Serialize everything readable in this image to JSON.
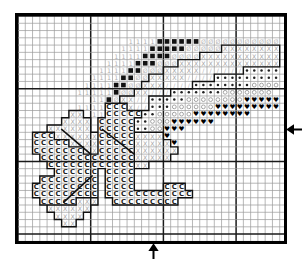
{
  "doc": {
    "kind": "cross-stitch-pattern-chart",
    "title": "Cross Stitch Pattern Chart",
    "background_color": "#ffffff",
    "frame_color": "#000000"
  },
  "grid": {
    "columns": 37,
    "rows": 32,
    "cell_size_px": 7.27,
    "minor_line_color": "#9a9a9a",
    "major_line_color": "#1a1a1a",
    "major_every": 10,
    "major_columns": [
      0,
      10,
      20,
      30,
      37
    ],
    "major_rows": [
      0,
      10,
      20,
      30,
      32
    ]
  },
  "markers": {
    "right_arrow": {
      "name": "center-marker-right",
      "glyph": "←",
      "row": 15
    },
    "bottom_arrow": {
      "name": "center-marker-bottom",
      "glyph": "↑",
      "column": 18
    }
  },
  "symbols": {
    "1": {
      "id": "one",
      "glyph": "1",
      "color": "#b0b0b0",
      "description": "light gray numeral one"
    },
    "B": {
      "id": "black-square",
      "glyph": "■",
      "color": "#111111",
      "description": "solid black square"
    },
    "O": {
      "id": "slashed-o",
      "glyph": "Ø",
      "color": "#bdbdbd",
      "description": "gray slashed O"
    },
    "X": {
      "id": "cross-x",
      "glyph": "X",
      "color": "#9e9e9e",
      "description": "gray letter X"
    },
    "S": {
      "id": "slash",
      "glyph": "/",
      "color": "#b5b5b5",
      "description": "gray forward slash"
    },
    "D": {
      "id": "dot",
      "glyph": "•",
      "color": "#222222",
      "description": "small filled dot"
    },
    "C": {
      "id": "open-circle",
      "glyph": "○",
      "color": "#9a9a9a",
      "description": "gray open circle"
    },
    "H": {
      "id": "heart",
      "glyph": "♥",
      "color": "#000000",
      "description": "solid black heart"
    },
    "c": {
      "id": "letter-c",
      "glyph": "C",
      "color": "#1a1a1a",
      "description": "bold letter C"
    }
  },
  "chart_data": {
    "type": "heatmap",
    "xlabel": "",
    "ylabel": "",
    "legend_position": "none",
    "grid": true,
    "columns": 37,
    "rows": 32,
    "symbol_rows": [
      ".....................................",
      ".....................................",
      ".....................................",
      "...............1111BBBBBBOOOOOOOOOOO.",
      "..............1111BBBBBOOOOOXXXXXXXX.",
      ".............1111BBBBOOOOXXXXXXXXXXX.",
      "............1111BBBOOOXXXXXXXXXXXXXX.",
      "...........1111BBOOOXXXXXSSSSSSDDDDD.",
      "..........1111BBOOXXXXXSSSSDDDDDDDDD.",
      ".........1111BBOOXXXSSSSDDDDDDDDCCCC.",
      "........11111BOOXXSSSDDDDDDDCCCCCCC.",
      "..........11BOXXSSDDDDDCCCCCCCCHHHHH.",
      "........1111cccXSSDDDCCCCCCHHHHHHHHH.",
      ".......XX.11cccccDDCCCCCHHHHHHHH.....",
      "......XXXX.cccccDDCCCHHHHHH..........",
      "....XXXXXX.cccccDDCCHHH..............",
      "..cccXXXXXXcccccXXXXH................",
      "..cccccXXXXcccccXXXXXH...............",
      "..cccccccXXcccccXXXXXX...............",
      "...cccccccccccccXXXXX................",
      "....ccccccccccccXX...................",
      ".....cccccc.cccc.....................",
      "...cccccccc.cccc.....................",
      "..ccccccccc.cccc....ccc..............",
      "..ccccccccc.cccccccccccc.............",
      "...cccccXXX..ccccccccc...............",
      "....XXXXXX...........................",
      ".....XXXX............................",
      "......XX.............................",
      ".....................................",
      ".....................................",
      "....................................."
    ],
    "symbol_counts": {
      "1": 38,
      "B": 31,
      "O": 44,
      "X": 118,
      "S": 31,
      "D": 72,
      "C": 62,
      "H": 46,
      "c": 150
    }
  },
  "backstitch": {
    "color": "#111111",
    "width_px": 1.6,
    "lines": [
      {
        "name": "petal-vein-upper-left",
        "x1": 10.0,
        "y1": 19.0,
        "x2": 6.0,
        "y2": 15.6
      },
      {
        "name": "petal-vein-center",
        "x1": 16.0,
        "y1": 19.0,
        "x2": 11.6,
        "y2": 15.6
      },
      {
        "name": "petal-vein-lower-left",
        "x1": 10.2,
        "y1": 22.0,
        "x2": 6.3,
        "y2": 25.6
      }
    ]
  },
  "outlines": {
    "color": "#111111",
    "width_px": 1.4,
    "description": "Heavy outlines traced around the C-symbol petal blocks and the X-symbol leaf blocks"
  }
}
